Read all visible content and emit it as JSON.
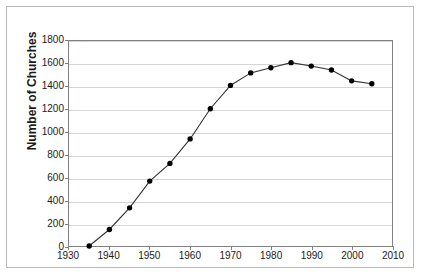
{
  "chart_data": {
    "type": "line",
    "title": "",
    "xlabel": "",
    "ylabel": "Number of Churches",
    "xlim": [
      1930,
      2010
    ],
    "ylim": [
      0,
      1800
    ],
    "xticks": [
      1930,
      1940,
      1950,
      1960,
      1970,
      1980,
      1990,
      2000,
      2010
    ],
    "yticks": [
      0,
      200,
      400,
      600,
      800,
      1000,
      1200,
      1400,
      1600,
      1800
    ],
    "grid": "horizontal",
    "legend": "none",
    "marker": "filled-circle",
    "line_color": "#333333",
    "marker_color": "#000000",
    "x": [
      1935,
      1940,
      1945,
      1950,
      1955,
      1960,
      1965,
      1970,
      1975,
      1980,
      1985,
      1990,
      1995,
      2000,
      2005
    ],
    "values": [
      0,
      145,
      335,
      570,
      725,
      940,
      1205,
      1410,
      1520,
      1565,
      1610,
      1580,
      1545,
      1450,
      1425
    ],
    "series": [
      {
        "name": "Number of Churches",
        "values": [
          0,
          145,
          335,
          570,
          725,
          940,
          1205,
          1410,
          1520,
          1565,
          1610,
          1580,
          1545,
          1450,
          1425
        ]
      }
    ]
  }
}
